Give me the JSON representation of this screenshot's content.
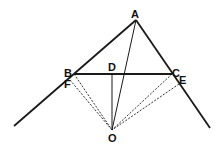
{
  "diagram": {
    "type": "geometry",
    "labels": {
      "A": "A",
      "B": "B",
      "C": "C",
      "D": "D",
      "E": "E",
      "F": "F",
      "O": "O"
    },
    "points": {
      "A": [
        136,
        20
      ],
      "B": [
        74,
        74
      ],
      "C": [
        172,
        74
      ],
      "D": [
        112,
        74
      ],
      "E": [
        180,
        84
      ],
      "F": [
        70,
        86
      ],
      "O": [
        112,
        130
      ]
    },
    "solid_segments": [
      [
        "A",
        "B"
      ],
      [
        "A",
        "C"
      ],
      [
        "B",
        "C"
      ],
      [
        "A",
        "O"
      ],
      [
        "D",
        "O"
      ]
    ],
    "extended_rays": [
      [
        "A",
        "B",
        "left-end"
      ],
      [
        "A",
        "C",
        "right-end"
      ]
    ],
    "dashed_segments": [
      [
        "B",
        "O"
      ],
      [
        "F",
        "O"
      ],
      [
        "C",
        "O"
      ],
      [
        "E",
        "O"
      ]
    ],
    "line_color": "#1a1a1a"
  }
}
